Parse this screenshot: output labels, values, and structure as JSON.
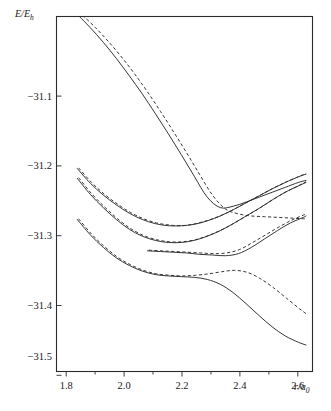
{
  "chart_data": {
    "type": "line",
    "title": "",
    "subtitle": "",
    "xlabel": "r/a0",
    "xlabel_parts": {
      "main": "r/a",
      "sub": "0"
    },
    "ylabel": "E/Eh",
    "ylabel_parts": {
      "main": "E/E",
      "sub": "h"
    },
    "xlim": [
      1.72,
      2.705
    ],
    "ylim": [
      -31.545,
      -31.036
    ],
    "grid": false,
    "legend": null,
    "x_ticks": [
      1.8,
      2.0,
      2.2,
      2.4,
      2.6
    ],
    "x_tick_labels": [
      "1.8",
      "2.0",
      "2.2",
      "2.4",
      "2.6"
    ],
    "x_minor_ticks": [
      1.9,
      2.1,
      2.3,
      2.5
    ],
    "y_ticks": [
      -31.1,
      -31.2,
      -31.3,
      -31.4,
      -31.5
    ],
    "y_tick_labels": [
      "−31.1",
      "−31.2",
      "−31.3",
      "−31.4",
      "−31.5"
    ],
    "series": [
      {
        "name": "upper-repulsive-solid",
        "style": "solid",
        "x": [
          1.8,
          1.85,
          1.9,
          1.95,
          2.0,
          2.05,
          2.1,
          2.15,
          2.2,
          2.25,
          2.3,
          2.35,
          2.4,
          2.45,
          2.5,
          2.55,
          2.6,
          2.65,
          2.68
        ],
        "y": [
          -31.033,
          -31.052,
          -31.073,
          -31.096,
          -31.121,
          -31.147,
          -31.175,
          -31.204,
          -31.234,
          -31.265,
          -31.295,
          -31.31,
          -31.308,
          -31.302,
          -31.295,
          -31.288,
          -31.281,
          -31.274,
          -31.271
        ]
      },
      {
        "name": "upper-repulsive-dashed",
        "style": "dashed",
        "x": [
          1.82,
          1.87,
          1.92,
          1.97,
          2.02,
          2.07,
          2.12,
          2.17,
          2.22,
          2.27,
          2.32,
          2.37,
          2.42,
          2.47,
          2.52,
          2.57,
          2.62,
          2.67,
          2.68
        ],
        "y": [
          -31.034,
          -31.052,
          -31.072,
          -31.094,
          -31.118,
          -31.144,
          -31.172,
          -31.201,
          -31.231,
          -31.262,
          -31.292,
          -31.312,
          -31.319,
          -31.322,
          -31.323,
          -31.324,
          -31.325,
          -31.326,
          -31.326
        ]
      },
      {
        "name": "mid-upper-well-solid",
        "style": "solid",
        "x": [
          1.8,
          1.85,
          1.9,
          1.95,
          2.0,
          2.05,
          2.1,
          2.15,
          2.2,
          2.25,
          2.3,
          2.35,
          2.4,
          2.45,
          2.5,
          2.55,
          2.6,
          2.65,
          2.68
        ],
        "y": [
          -31.254,
          -31.275,
          -31.292,
          -31.306,
          -31.318,
          -31.327,
          -31.333,
          -31.336,
          -31.336,
          -31.334,
          -31.329,
          -31.322,
          -31.313,
          -31.303,
          -31.293,
          -31.283,
          -31.274,
          -31.266,
          -31.262
        ]
      },
      {
        "name": "mid-upper-well-dashed",
        "style": "dashed",
        "x": [
          1.805,
          1.855,
          1.905,
          1.955,
          2.005,
          2.055,
          2.105,
          2.155,
          2.205,
          2.255,
          2.305,
          2.355,
          2.405,
          2.455,
          2.505,
          2.555,
          2.605,
          2.655,
          2.68
        ],
        "y": [
          -31.253,
          -31.274,
          -31.291,
          -31.305,
          -31.317,
          -31.326,
          -31.332,
          -31.335,
          -31.336,
          -31.333,
          -31.328,
          -31.321,
          -31.312,
          -31.302,
          -31.292,
          -31.282,
          -31.273,
          -31.265,
          -31.261
        ]
      },
      {
        "name": "mid-lower-well-solid",
        "style": "solid",
        "x": [
          1.8,
          1.85,
          1.9,
          1.95,
          2.0,
          2.05,
          2.1,
          2.15,
          2.2,
          2.25,
          2.3,
          2.35,
          2.4,
          2.45,
          2.5,
          2.55,
          2.6,
          2.65,
          2.68
        ],
        "y": [
          -31.268,
          -31.291,
          -31.31,
          -31.327,
          -31.341,
          -31.351,
          -31.357,
          -31.36,
          -31.36,
          -31.357,
          -31.351,
          -31.343,
          -31.333,
          -31.322,
          -31.311,
          -31.299,
          -31.288,
          -31.279,
          -31.274
        ]
      },
      {
        "name": "mid-lower-well-dashed",
        "style": "dashed",
        "x": [
          1.805,
          1.855,
          1.905,
          1.955,
          2.005,
          2.055,
          2.105,
          2.155,
          2.205,
          2.255,
          2.305,
          2.355,
          2.405,
          2.455,
          2.505,
          2.555,
          2.605,
          2.655,
          2.68
        ],
        "y": [
          -31.267,
          -31.29,
          -31.309,
          -31.326,
          -31.34,
          -31.35,
          -31.356,
          -31.359,
          -31.359,
          -31.356,
          -31.35,
          -31.342,
          -31.332,
          -31.321,
          -31.31,
          -31.298,
          -31.287,
          -31.278,
          -31.273
        ]
      },
      {
        "name": "avoided-crossing-branch-solid",
        "style": "solid",
        "x": [
          2.07,
          2.12,
          2.17,
          2.22,
          2.27,
          2.32,
          2.37,
          2.42,
          2.47,
          2.52,
          2.57,
          2.62,
          2.67,
          2.68
        ],
        "y": [
          -31.372,
          -31.373,
          -31.374,
          -31.375,
          -31.377,
          -31.378,
          -31.379,
          -31.376,
          -31.367,
          -31.355,
          -31.343,
          -31.332,
          -31.324,
          -31.322
        ]
      },
      {
        "name": "avoided-crossing-branch-dashed",
        "style": "dashed",
        "x": [
          2.075,
          2.125,
          2.175,
          2.225,
          2.275,
          2.325,
          2.375,
          2.425,
          2.475,
          2.525,
          2.575,
          2.625,
          2.675,
          2.68
        ],
        "y": [
          -31.371,
          -31.372,
          -31.373,
          -31.374,
          -31.375,
          -31.376,
          -31.375,
          -31.37,
          -31.36,
          -31.349,
          -31.338,
          -31.328,
          -31.32,
          -31.319
        ]
      },
      {
        "name": "lower-well-solid",
        "style": "solid",
        "x": [
          1.8,
          1.85,
          1.9,
          1.95,
          2.0,
          2.05,
          2.1,
          2.15,
          2.2,
          2.25,
          2.3,
          2.35,
          2.4,
          2.45,
          2.5,
          2.55,
          2.6,
          2.65,
          2.68
        ],
        "y": [
          -31.327,
          -31.349,
          -31.367,
          -31.382,
          -31.393,
          -31.401,
          -31.406,
          -31.408,
          -31.409,
          -31.41,
          -31.413,
          -31.42,
          -31.432,
          -31.448,
          -31.465,
          -31.481,
          -31.494,
          -31.503,
          -31.507
        ]
      },
      {
        "name": "lower-well-dashed",
        "style": "dashed",
        "x": [
          1.805,
          1.855,
          1.905,
          1.955,
          2.005,
          2.055,
          2.105,
          2.155,
          2.205,
          2.255,
          2.305,
          2.355,
          2.405,
          2.455,
          2.505,
          2.555,
          2.605,
          2.655,
          2.68
        ],
        "y": [
          -31.326,
          -31.348,
          -31.366,
          -31.381,
          -31.392,
          -31.4,
          -31.405,
          -31.407,
          -31.408,
          -31.407,
          -31.405,
          -31.402,
          -31.4,
          -31.403,
          -31.412,
          -31.425,
          -31.44,
          -31.455,
          -31.462
        ]
      }
    ]
  },
  "accent_color": "#2b2b2b",
  "background_color": "#ffffff"
}
